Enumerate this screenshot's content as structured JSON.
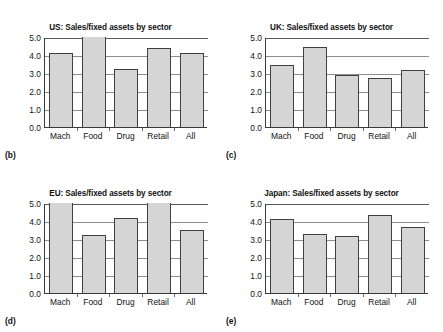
{
  "figure": {
    "categories": [
      "Mach",
      "Food",
      "Drug",
      "Retail",
      "All"
    ],
    "y_ticks": [
      "0.0",
      "1.0",
      "2.0",
      "3.0",
      "4.0",
      "5.0"
    ],
    "ylim": [
      0,
      5
    ],
    "bar_color": "#d5d5d5",
    "bar_edge_color": "#404040",
    "grid_color": "#8d8d8d"
  },
  "panels": [
    {
      "key": "us",
      "title": "US: Sales/fixed assets by sector",
      "subfig_label": "(b)",
      "values": [
        4.1,
        5.1,
        3.2,
        4.4,
        4.1
      ],
      "clipped": [
        false,
        true,
        false,
        false,
        false
      ]
    },
    {
      "key": "uk",
      "title": "UK: Sales/fixed assets by sector",
      "subfig_label": "(c)",
      "values": [
        3.45,
        4.45,
        2.9,
        2.75,
        3.15
      ],
      "clipped": [
        false,
        false,
        false,
        false,
        false
      ]
    },
    {
      "key": "eu",
      "title": "EU: Sales/fixed assets by sector",
      "subfig_label": "(d)",
      "values": [
        5.0,
        3.2,
        4.15,
        5.0,
        3.5
      ],
      "clipped": [
        true,
        false,
        false,
        true,
        false
      ]
    },
    {
      "key": "japan",
      "title": "Japan: Sales/fixed assets by sector",
      "subfig_label": "(e)",
      "values": [
        4.1,
        3.3,
        3.15,
        4.35,
        3.65
      ],
      "clipped": [
        false,
        false,
        false,
        false,
        false
      ]
    }
  ],
  "chart_data": {
    "type": "bar",
    "title": "Sales/fixed assets by sector",
    "xlabel": "",
    "ylabel": "",
    "ylim": [
      0,
      5
    ],
    "yticks": [
      0.0,
      1.0,
      2.0,
      3.0,
      4.0,
      5.0
    ],
    "grid": true,
    "legend": "none",
    "categories": [
      "Mach",
      "Food",
      "Drug",
      "Retail",
      "All"
    ],
    "panels": [
      {
        "label": "(b)",
        "title": "US: Sales/fixed assets by sector",
        "region": "US",
        "values": [
          4.1,
          5.1,
          3.2,
          4.4,
          4.1
        ],
        "note": "Food bar exceeds the 5.0 axis maximum"
      },
      {
        "label": "(c)",
        "title": "UK: Sales/fixed assets by sector",
        "region": "UK",
        "values": [
          3.45,
          4.45,
          2.9,
          2.75,
          3.15
        ],
        "note": ""
      },
      {
        "label": "(d)",
        "title": "EU: Sales/fixed assets by sector",
        "region": "EU",
        "values": [
          5.0,
          3.2,
          4.15,
          5.0,
          3.5
        ],
        "note": "Mach and Retail bars are clipped at the 5.0 axis maximum"
      },
      {
        "label": "(e)",
        "title": "Japan: Sales/fixed assets by sector",
        "region": "Japan",
        "values": [
          4.1,
          3.3,
          3.15,
          4.35,
          3.65
        ],
        "note": ""
      }
    ]
  }
}
